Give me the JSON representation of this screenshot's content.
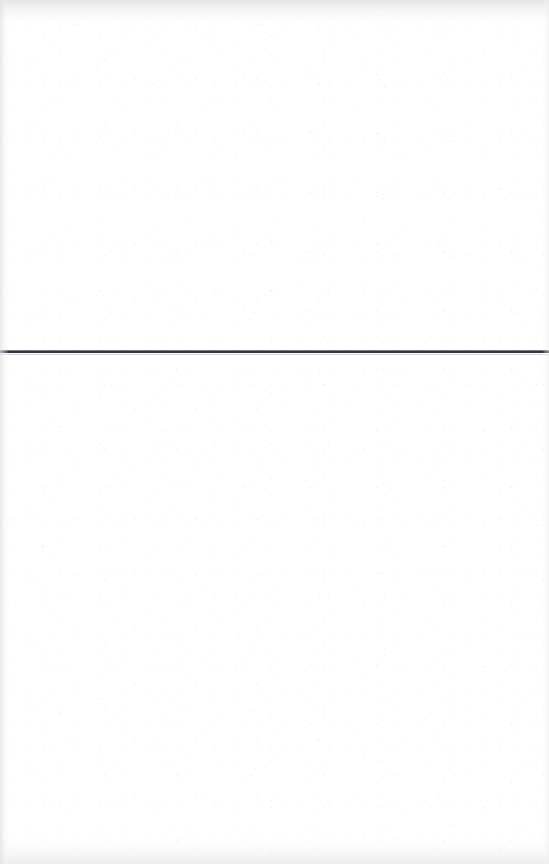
{
  "document": {
    "kind": "scanned-page",
    "page_width": 549,
    "page_height": 864,
    "background_color": "#ffffff",
    "visible_text": "",
    "body_text_above_rule": "",
    "body_text_below_rule": "",
    "notes": ""
  },
  "rule": {
    "label": "horizontal-rule",
    "y": 351,
    "x_start": 0,
    "x_end": 549,
    "thickness_px": 2,
    "color": "#33333b",
    "highlight_color": "#787882",
    "ghost_color": "#d6d6dc"
  },
  "texture": {
    "grain_color": "#c0c0c6",
    "edge_shade_top": "#e4e4e6",
    "edge_shade_bottom": "#e8e8ea",
    "edge_shade_left": "#e2e2e5",
    "edge_shade_right": "#ececee"
  }
}
